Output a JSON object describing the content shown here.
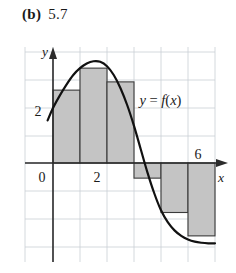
{
  "caption": {
    "label": "(b)",
    "value": "5.7"
  },
  "chart_data": {
    "type": "bar",
    "title": "",
    "subtitle": "",
    "xlabel": "x",
    "ylabel": "y",
    "grid": true,
    "legend_position": "none",
    "xlim": [
      -1,
      7
    ],
    "ylim": [
      -3,
      4
    ],
    "x_ticks": [
      {
        "value": 0,
        "label": "0"
      },
      {
        "value": 2,
        "label": "2"
      },
      {
        "value": 6,
        "label": "6"
      }
    ],
    "y_ticks": [
      {
        "value": 2,
        "label": "2"
      }
    ],
    "annotations": [
      {
        "text": "y = f(x)",
        "x": 3.2,
        "y": 2.1
      }
    ],
    "bar_width": 1,
    "categories": [
      "[0,1]",
      "[1,2]",
      "[2,3]",
      "[3,4]",
      "[4,5]",
      "[5,6]"
    ],
    "values": [
      2.65,
      3.45,
      2.95,
      -0.55,
      -1.8,
      -2.65
    ],
    "series": [
      {
        "name": "midpoint rectangles",
        "values": [
          2.65,
          3.45,
          2.95,
          -0.55,
          -1.8,
          -2.65
        ]
      }
    ],
    "curve": {
      "name": "y = f(x)",
      "x": [
        -0.2,
        0.0,
        0.25,
        0.5,
        0.75,
        1.0,
        1.25,
        1.5,
        1.75,
        2.0,
        2.25,
        2.5,
        2.75,
        3.0,
        3.25,
        3.5,
        3.75,
        4.0,
        4.25,
        4.5,
        4.75,
        5.0,
        5.25,
        5.5,
        5.75,
        6.0
      ],
      "y": [
        1.55,
        2.0,
        2.45,
        2.85,
        3.2,
        3.45,
        3.62,
        3.7,
        3.68,
        3.52,
        3.2,
        2.72,
        2.1,
        1.35,
        0.5,
        -0.35,
        -1.1,
        -1.72,
        -2.15,
        -2.45,
        -2.65,
        -2.78,
        -2.86,
        -2.9,
        -2.92,
        -2.92
      ]
    }
  },
  "colors": {
    "bar_fill": "#c4c4c4",
    "bar_stroke": "#3a3a3a",
    "curve": "#111111",
    "grid": "#c9cfd4",
    "axis": "#2b2b2b",
    "text": "#1a1a1a"
  }
}
